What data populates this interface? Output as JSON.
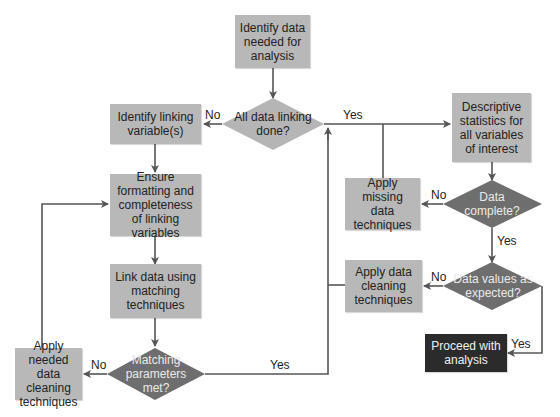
{
  "diagram": {
    "type": "flowchart",
    "colors": {
      "process_box": "#b8b8b8",
      "decision_light": "#b5b5b5",
      "decision_dark": "#6e6e6e",
      "terminal_box": "#2b2b2b",
      "line": "#555555"
    },
    "nodes": {
      "identify_data": "Identify data needed for analysis",
      "all_linking_done": "All data linking done?",
      "identify_linking": "Identify linking variable(s)",
      "ensure_formatting": "Ensure formatting and completeness of linking variables",
      "link_data": "Link data using matching techniques",
      "matching_met": "Matching parameters met?",
      "apply_needed_cleaning": "Apply needed data cleaning techniques",
      "descriptive_stats": "Descriptive statistics for all variables of interest",
      "data_complete": "Data complete?",
      "apply_missing": "Apply missing data techniques",
      "values_expected": "Data values as expected?",
      "apply_cleaning": "Apply data cleaning techniques",
      "proceed": "Proceed with analysis"
    },
    "edge_labels": {
      "linking_no": "No",
      "linking_yes": "Yes",
      "complete_no": "No",
      "complete_yes": "Yes",
      "expected_no": "No",
      "expected_yes": "Yes",
      "matching_no": "No",
      "matching_yes": "Yes"
    }
  }
}
